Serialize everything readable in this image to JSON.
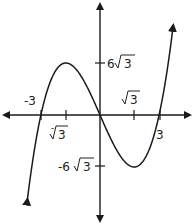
{
  "chart_data": {
    "type": "line",
    "title": "",
    "xlabel": "",
    "ylabel": "",
    "function": "f(x) = x^3 - 9x",
    "grid": false,
    "legend": null,
    "series": [
      {
        "name": "f(x)",
        "color": "#1a1a1a",
        "x_range": [
          -3.7,
          3.7
        ],
        "key_points": [
          {
            "x": -3,
            "y": 0,
            "note": "x-intercept"
          },
          {
            "x": -1.732,
            "y": 10.392,
            "note": "local max at (-√3, 6√3)"
          },
          {
            "x": 0,
            "y": 0,
            "note": "intercept"
          },
          {
            "x": 1.732,
            "y": -10.392,
            "note": "local min at (√3, -6√3)"
          },
          {
            "x": 3,
            "y": 0,
            "note": "x-intercept"
          }
        ],
        "ends": "arrows on both ends (down-left, up-right)"
      }
    ],
    "x_ticks": [
      {
        "value": -3,
        "label": "-3"
      },
      {
        "value": -1.732,
        "label": "-√3"
      },
      {
        "value": 1.732,
        "label": "√3"
      },
      {
        "value": 3,
        "label": "3"
      }
    ],
    "y_ticks": [
      {
        "value": 10.392,
        "label": "6√3"
      },
      {
        "value": -10.392,
        "label": "-6√3"
      }
    ],
    "axes": {
      "x_arrows": true,
      "y_arrows": true
    }
  },
  "labels": {
    "x_neg3": "-3",
    "x_negroot3_coef": "-",
    "x_root3": "3",
    "x_pos3": "3",
    "y_pos_coef": "6",
    "y_pos_rad": "3",
    "y_neg_coef": "-6",
    "y_neg_rad": "3"
  },
  "style": {
    "curve_color": "#1a1a1a",
    "axis_color": "#1a1a1a",
    "background": "#ffffff"
  }
}
